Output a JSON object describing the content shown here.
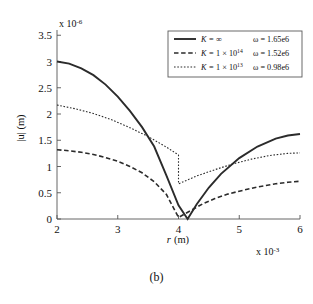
{
  "figure": {
    "caption": "(b)"
  },
  "chart_data": {
    "type": "line",
    "title": "",
    "xlabel": "r (m)",
    "xlabel_symbol": "r",
    "xlabel_unit": "(m)",
    "ylabel": "|u| (m)",
    "x_exponent_text": "x 10",
    "x_exponent_power": "-3",
    "y_exponent_text": "x 10",
    "y_exponent_power": "-6",
    "xlim": [
      2,
      6
    ],
    "ylim": [
      0,
      3.6
    ],
    "x_ticks": [
      "2",
      "3",
      "4",
      "5",
      "6"
    ],
    "x_tick_values": [
      2,
      3,
      4,
      5,
      6
    ],
    "y_ticks": [
      "0",
      "0.5",
      "1",
      "1.5",
      "2",
      "2.5",
      "3",
      "3.5"
    ],
    "y_tick_values": [
      0,
      0.5,
      1,
      1.5,
      2,
      2.5,
      3,
      3.5
    ],
    "grid": false,
    "legend_position": "top-right",
    "series": [
      {
        "name": "K = ∞",
        "k_symbol": "K",
        "k_value": "∞",
        "k_mantissa": "",
        "k_exponent": "",
        "omega_label": "ω = 1.65e6",
        "omega_value": 1650000,
        "style": "solid",
        "color": "#2b2b2b",
        "x": [
          2.0,
          2.2,
          2.4,
          2.6,
          2.8,
          3.0,
          3.2,
          3.4,
          3.6,
          3.8,
          4.0,
          4.15,
          4.3,
          4.5,
          4.7,
          5.0,
          5.3,
          5.6,
          5.8,
          6.0
        ],
        "y": [
          3.0,
          2.96,
          2.87,
          2.74,
          2.56,
          2.33,
          2.06,
          1.75,
          1.38,
          0.83,
          0.26,
          0.0,
          0.28,
          0.6,
          0.86,
          1.16,
          1.38,
          1.53,
          1.59,
          1.62
        ]
      },
      {
        "name": "K = 1 × 10^14",
        "k_symbol": "K",
        "k_value": "1 × 10",
        "k_mantissa": "1 × 10",
        "k_exponent": "14",
        "omega_label": "ω = 1.52e6",
        "omega_value": 1520000,
        "style": "dashed",
        "color": "#2b2b2b",
        "x": [
          2.0,
          2.2,
          2.4,
          2.6,
          2.8,
          3.0,
          3.2,
          3.4,
          3.6,
          3.8,
          4.0,
          4.2,
          4.4,
          4.6,
          4.8,
          5.0,
          5.3,
          5.6,
          5.8,
          6.0
        ],
        "y": [
          1.32,
          1.3,
          1.27,
          1.23,
          1.17,
          1.1,
          1.0,
          0.88,
          0.71,
          0.47,
          0.03,
          0.16,
          0.29,
          0.39,
          0.47,
          0.53,
          0.61,
          0.67,
          0.7,
          0.72
        ]
      },
      {
        "name": "K = 1 × 10^13",
        "k_symbol": "K",
        "k_value": "1 × 10",
        "k_mantissa": "1 × 10",
        "k_exponent": "13",
        "omega_label": "ω = 0.98e6",
        "omega_value": 980000,
        "style": "dotted",
        "color": "#2b2b2b",
        "x": [
          2.0,
          2.3,
          2.6,
          2.9,
          3.2,
          3.5,
          3.8,
          4.0,
          4.0,
          4.3,
          4.6,
          4.9,
          5.2,
          5.5,
          5.8,
          6.0
        ],
        "y": [
          2.17,
          2.1,
          2.01,
          1.89,
          1.74,
          1.57,
          1.37,
          1.22,
          0.67,
          0.82,
          0.94,
          1.05,
          1.14,
          1.21,
          1.25,
          1.26
        ],
        "discontinuity_at_x": 4.0,
        "discontinuity_from_y": 1.22,
        "discontinuity_to_y": 0.67
      }
    ]
  }
}
